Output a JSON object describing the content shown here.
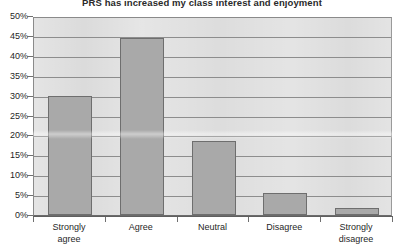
{
  "chart_data": {
    "type": "bar",
    "title": "PRS has increased my class interest and enjoyment",
    "xlabel": "",
    "ylabel": "",
    "categories": [
      "Strongly agree",
      "Agree",
      "Neutral",
      "Disagree",
      "Strongly disagree"
    ],
    "values": [
      30,
      44.5,
      18.7,
      5.5,
      1.8
    ],
    "ylim": [
      0,
      50
    ],
    "yticks": [
      0,
      5,
      10,
      15,
      20,
      25,
      30,
      35,
      40,
      45,
      50
    ],
    "ytick_labels": [
      "0%",
      "5%",
      "10%",
      "15%",
      "20%",
      "25%",
      "30%",
      "35%",
      "40%",
      "45%",
      "50%"
    ],
    "grid": true,
    "legend": false,
    "legend_position": "none",
    "bar_color": "#a9a9a9",
    "bar_border_color": "#6e6e6e",
    "plot_background": "#d9d9d9",
    "gridline_color": "#8d8d8d",
    "text_color": "#1f1f1f"
  },
  "category_lines": [
    [
      "Strongly",
      "agree"
    ],
    [
      "Agree",
      ""
    ],
    [
      "Neutral",
      ""
    ],
    [
      "Disagree",
      ""
    ],
    [
      "Strongly",
      "disagree"
    ]
  ]
}
